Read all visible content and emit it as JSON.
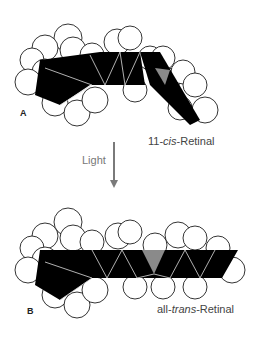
{
  "figure": {
    "panels": [
      {
        "letter": "A",
        "caption_pre": "11-",
        "caption_italic": "cis",
        "caption_post": "-Retinal"
      },
      {
        "letter": "B",
        "caption_pre": "all-",
        "caption_italic": "trans",
        "caption_post": "-Retinal"
      }
    ],
    "arrow_label": "Light",
    "colors": {
      "bond": "#000000",
      "atom": "#ffffff",
      "highlight": "#8a8a8a",
      "arrow": "#7a7a7a"
    }
  }
}
